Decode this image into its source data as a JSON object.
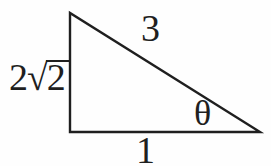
{
  "figure": {
    "type": "right-triangle-diagram",
    "background": "#fefefe",
    "line_color": "#1f1f1f",
    "labels": {
      "hypotenuse": "3",
      "base": "1",
      "angle": "θ",
      "left_side": {
        "text": "2√2",
        "coefficient": "2",
        "radical": "√",
        "radicand": "2"
      }
    }
  }
}
